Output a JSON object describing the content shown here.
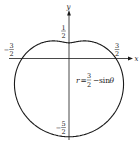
{
  "figure": {
    "type": "polar-plot",
    "equation": {
      "lhs": "r",
      "eq": "=",
      "frac_num": "3",
      "frac_den": "2",
      "minus": "−",
      "func": "sin",
      "var": "θ"
    },
    "axes": {
      "x_label": "x",
      "y_label": "y"
    },
    "tick_labels": {
      "top": {
        "sign": "",
        "num": "1",
        "den": "2"
      },
      "left": {
        "sign": "−",
        "num": "3",
        "den": "2"
      },
      "right": {
        "sign": "",
        "num": "3",
        "den": "2"
      },
      "bottom": {
        "sign": "−",
        "num": "5",
        "den": "2"
      }
    },
    "colors": {
      "curve": "#1a1a1a",
      "axes": "#1a1a1a",
      "background": "#ffffff"
    }
  },
  "curve": {
    "a": 1.5,
    "b": -1,
    "origin_px": [
      69,
      58.5
    ],
    "scale_px_per_unit": 31.3
  }
}
